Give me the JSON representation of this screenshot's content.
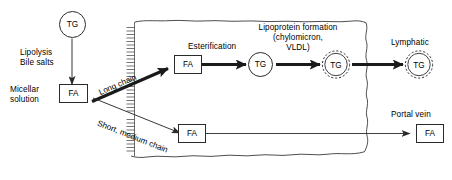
{
  "diagram": {
    "colors": {
      "stroke": "#2b2b2b",
      "text": "#000000",
      "background": "#ffffff"
    },
    "nodes": {
      "tg_lumen": "TG",
      "fa_micellar": "FA",
      "fa_long_chain": "FA",
      "fa_short_medium": "FA",
      "tg_smooth_er": "TG",
      "tg_chylomicron": "TG",
      "tg_lymphatic": "TG",
      "fa_portal": "FA"
    },
    "labels": {
      "lipolysis": "Lipolysis",
      "bile_salts": "Bile salts",
      "micellar": "Micellar",
      "solution": "solution",
      "long_chain": "Long chain",
      "short_medium_chain": "Short, medium chain",
      "esterification": "Esterification",
      "lipoprotein_line1": "Lipoprotein formation",
      "lipoprotein_line2": "(chylomicron,",
      "lipoprotein_line3": "VLDL)",
      "lymphatic": "Lymphatic",
      "portal_vein": "Portal vein"
    },
    "icons": {
      "brush_border": "microvilli-brush-border",
      "cell_membrane": "enterocyte-cell-outline",
      "chylomicron": "chylomicron-spiky-circle",
      "arrow_thin": "thin-arrow",
      "arrow_thick": "thick-arrow"
    }
  }
}
